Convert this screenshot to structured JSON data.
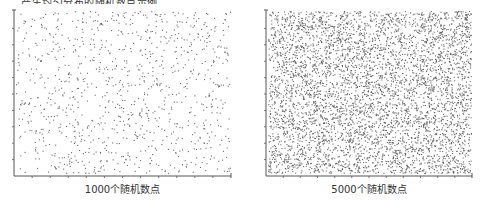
{
  "top_text_cut": "……产生均匀分布的随机数点示例……",
  "chart_data": [
    {
      "type": "scatter",
      "title": "",
      "caption": "1000个随机数点",
      "n_points": 1000,
      "distribution": "uniform",
      "xlabel": "1000个随机数点",
      "ylabel": "",
      "xlim": [
        0,
        1
      ],
      "ylim": [
        0,
        1
      ],
      "x_ticks": 12,
      "y_ticks": 10,
      "tick_labels": false,
      "grid": false,
      "marker_color": "#555555"
    },
    {
      "type": "scatter",
      "title": "",
      "caption": "5000个随机数点",
      "n_points": 5000,
      "distribution": "uniform",
      "xlabel": "5000个随机数点",
      "ylabel": "",
      "xlim": [
        0,
        1
      ],
      "ylim": [
        0,
        1
      ],
      "x_ticks": 12,
      "y_ticks": 10,
      "tick_labels": false,
      "grid": false,
      "marker_color": "#555555"
    }
  ],
  "captions": {
    "left": "1000个随机数点",
    "right": "5000个随机数点"
  }
}
